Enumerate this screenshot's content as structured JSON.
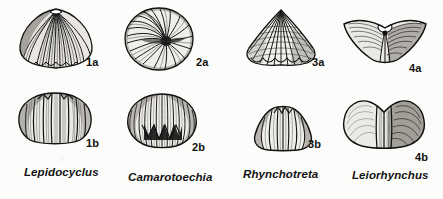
{
  "plate": {
    "background_color": "#fcfcfa",
    "ink_color": "#1a1a1a",
    "caption_style": "italic",
    "description": "Figure plate of four rhynchonellid brachiopod genera, each shown in two views"
  },
  "columns": [
    {
      "genus": "Lepidocyclus",
      "genus_label_x": 24,
      "genus_label_y": 168,
      "views": [
        {
          "figure_number": "1a",
          "view": "dorsal-exterior",
          "label_x": 86,
          "label_y": 62,
          "shape": "rounded-subtriangular ribbed valve with apical beak",
          "rib_count": 20
        },
        {
          "figure_number": "1b",
          "view": "anterior",
          "label_x": 86,
          "label_y": 143,
          "shape": "broad anterior view with strong plications and high fold",
          "rib_count": 9
        }
      ]
    },
    {
      "genus": "Camarotoechia",
      "genus_label_x": 128,
      "genus_label_y": 173,
      "views": [
        {
          "figure_number": "2a",
          "view": "posterior-oblique",
          "label_x": 196,
          "label_y": 62,
          "shape": "subcircular valve with radiating curved costae converging at beak",
          "rib_count": 24
        },
        {
          "figure_number": "2b",
          "view": "anterior",
          "label_x": 192,
          "label_y": 147,
          "shape": "globose anterior view with zigzag commissure",
          "rib_count": 14
        }
      ]
    },
    {
      "genus": "Rhynchotreta",
      "genus_label_x": 243,
      "genus_label_y": 170,
      "views": [
        {
          "figure_number": "3a",
          "view": "dorsal-exterior",
          "label_x": 312,
          "label_y": 62,
          "shape": "triangular valve with sharp angular costae and crenulate margin",
          "rib_count": 16
        },
        {
          "figure_number": "3b",
          "view": "anterior",
          "label_x": 308,
          "label_y": 144,
          "shape": "trapezoidal anterior view with narrow raised fold",
          "rib_count": 7
        }
      ]
    },
    {
      "genus": "Leiorhynchus",
      "genus_label_x": 352,
      "genus_label_y": 171,
      "views": [
        {
          "figure_number": "4a",
          "view": "dorsal-exterior",
          "label_x": 409,
          "label_y": 68,
          "shape": "transversely wide alate shell with smooth flanks and median fold",
          "rib_count": 6
        },
        {
          "figure_number": "4b",
          "view": "anterior",
          "label_x": 415,
          "label_y": 157,
          "shape": "wide anterior view with broad smooth lateral slopes and central plicate fold",
          "rib_count": 5
        }
      ]
    }
  ]
}
